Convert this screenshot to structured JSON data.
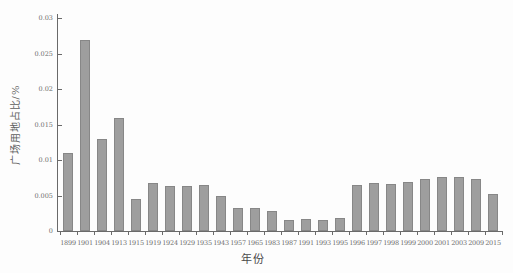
{
  "chart_data": {
    "type": "bar",
    "title": "",
    "xlabel": "年份",
    "ylabel": "广场用地占比/%",
    "categories": [
      "1899",
      "1901",
      "1904",
      "1913",
      "1915",
      "1919",
      "1924",
      "1929",
      "1935",
      "1943",
      "1957",
      "1965",
      "1983",
      "1987",
      "1991",
      "1993",
      "1995",
      "1996",
      "1997",
      "1998",
      "1999",
      "2000",
      "2001",
      "2003",
      "2009",
      "2015"
    ],
    "values": [
      0.011,
      0.027,
      0.013,
      0.016,
      0.0045,
      0.0067,
      0.0063,
      0.0063,
      0.0065,
      0.005,
      0.0032,
      0.0033,
      0.0028,
      0.0016,
      0.0017,
      0.0016,
      0.0018,
      0.0065,
      0.0067,
      0.0066,
      0.0069,
      0.0074,
      0.0076,
      0.0076,
      0.0074,
      0.0052
    ],
    "ylim": [
      0,
      0.03
    ],
    "yticks": [
      0,
      0.005,
      0.01,
      0.015,
      0.02,
      0.025,
      0.03
    ],
    "ytick_labels": [
      "0",
      "0.005",
      "0.01",
      "0.015",
      "0.02",
      "0.025",
      "0.03"
    ],
    "grid": false,
    "legend_position": "none",
    "bar_color": "#9e9e9e",
    "bar_edge_color": "#878787",
    "axis_color": "#6a6a6a",
    "tick_text_color": "#6e6e6e",
    "background_color": "#fdfdfd"
  }
}
